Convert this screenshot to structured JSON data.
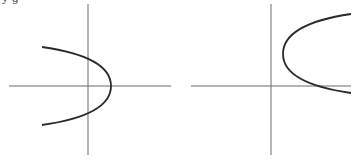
{
  "page_fragment_text": "y   g",
  "colors": {
    "axis": "#6b6b6b",
    "curve": "#2a2a2a"
  },
  "graphs": [
    {
      "id": "left",
      "description": "Parabola opening left, vertex right of origin on x-axis",
      "axes": {
        "x_axis": {
          "x1": 9,
          "x2": 171,
          "y": 86
        },
        "y_axis": {
          "x": 88,
          "y1": 4,
          "y2": 155
        }
      },
      "curve": {
        "start": [
          42,
          47
        ],
        "vertex": [
          111,
          86
        ],
        "end": [
          42,
          125
        ]
      }
    },
    {
      "id": "right",
      "description": "Parabola opening right, vertex in first quadrant",
      "axes": {
        "x_axis": {
          "x1": 191,
          "x2": 351,
          "y": 86
        },
        "y_axis": {
          "x": 271,
          "y1": 4,
          "y2": 155
        }
      },
      "curve": {
        "start": [
          351,
          14
        ],
        "vertex": [
          283,
          54
        ],
        "end": [
          351,
          93
        ]
      }
    }
  ]
}
